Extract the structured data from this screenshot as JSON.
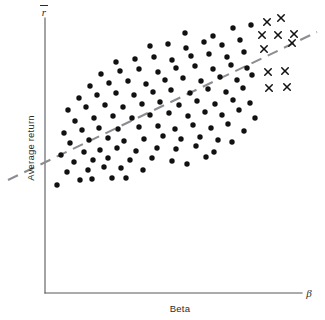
{
  "figure": {
    "title": "",
    "y_axis_symbol": "r",
    "y_axis_symbol_note": "r-bar (average return)",
    "x_axis_symbol": "β",
    "y_axis_label": "Average return",
    "x_axis_label": "Beta"
  },
  "colors": {
    "dot": "#111111",
    "cross": "#111111",
    "fit_line": "#8a8d91",
    "axis": "#55585c",
    "background": "#ffffff",
    "text": "#2b2b2b"
  },
  "chart_data": {
    "type": "scatter",
    "title": "",
    "xlabel": "Beta",
    "ylabel": "Average return",
    "xlim": [
      0,
      1
    ],
    "ylim": [
      0,
      1
    ],
    "grid": false,
    "legend": null,
    "axis_ticks": {
      "x": [],
      "y": []
    },
    "annotations": [
      {
        "text": "r",
        "role": "y-axis-symbol",
        "x": 0.0,
        "y": 1.0
      },
      {
        "text": "β",
        "role": "x-axis-symbol",
        "x": 1.0,
        "y": 0.0
      }
    ],
    "series": [
      {
        "name": "portfolios",
        "marker": "filled-circle",
        "color": "#111111",
        "size": 5.4,
        "count": 110,
        "points": [
          [
            57,
            185
          ],
          [
            80,
            180
          ],
          [
            92,
            179
          ],
          [
            112,
            178
          ],
          [
            126,
            178
          ],
          [
            67,
            172
          ],
          [
            88,
            170
          ],
          [
            104,
            167
          ],
          [
            121,
            168
          ],
          [
            143,
            170
          ],
          [
            74,
            162
          ],
          [
            93,
            160
          ],
          [
            108,
            158
          ],
          [
            130,
            160
          ],
          [
            152,
            158
          ],
          [
            172,
            161
          ],
          [
            187,
            164
          ],
          [
            206,
            157
          ],
          [
            61,
            155
          ],
          [
            84,
            152
          ],
          [
            100,
            150
          ],
          [
            117,
            148
          ],
          [
            136,
            151
          ],
          [
            157,
            148
          ],
          [
            176,
            149
          ],
          [
            196,
            146
          ],
          [
            214,
            152
          ],
          [
            70,
            143
          ],
          [
            89,
            140
          ],
          [
            108,
            138
          ],
          [
            124,
            141
          ],
          [
            144,
            139
          ],
          [
            163,
            136
          ],
          [
            181,
            139
          ],
          [
            200,
            137
          ],
          [
            218,
            140
          ],
          [
            232,
            142
          ],
          [
            64,
            133
          ],
          [
            82,
            130
          ],
          [
            99,
            128
          ],
          [
            118,
            129
          ],
          [
            139,
            127
          ],
          [
            158,
            126
          ],
          [
            175,
            129
          ],
          [
            193,
            125
          ],
          [
            211,
            128
          ],
          [
            228,
            124
          ],
          [
            244,
            131
          ],
          [
            75,
            121
          ],
          [
            94,
            118
          ],
          [
            113,
            116
          ],
          [
            132,
            118
          ],
          [
            150,
            115
          ],
          [
            169,
            113
          ],
          [
            188,
            116
          ],
          [
            205,
            112
          ],
          [
            222,
            115
          ],
          [
            239,
            110
          ],
          [
            255,
            118
          ],
          [
            68,
            110
          ],
          [
            86,
            107
          ],
          [
            105,
            105
          ],
          [
            123,
            107
          ],
          [
            142,
            104
          ],
          [
            160,
            102
          ],
          [
            179,
            105
          ],
          [
            197,
            101
          ],
          [
            215,
            104
          ],
          [
            233,
            100
          ],
          [
            250,
            103
          ],
          [
            79,
            98
          ],
          [
            97,
            95
          ],
          [
            116,
            93
          ],
          [
            134,
            95
          ],
          [
            153,
            92
          ],
          [
            171,
            90
          ],
          [
            190,
            93
          ],
          [
            208,
            89
          ],
          [
            226,
            92
          ],
          [
            243,
            88
          ],
          [
            90,
            86
          ],
          [
            109,
            83
          ],
          [
            128,
            81
          ],
          [
            146,
            84
          ],
          [
            165,
            80
          ],
          [
            183,
            78
          ],
          [
            201,
            81
          ],
          [
            220,
            77
          ],
          [
            237,
            80
          ],
          [
            252,
            75
          ],
          [
            101,
            74
          ],
          [
            120,
            71
          ],
          [
            139,
            69
          ],
          [
            158,
            72
          ],
          [
            176,
            68
          ],
          [
            195,
            66
          ],
          [
            213,
            69
          ],
          [
            231,
            65
          ],
          [
            247,
            68
          ],
          [
            116,
            62
          ],
          [
            135,
            59
          ],
          [
            154,
            57
          ],
          [
            172,
            60
          ],
          [
            191,
            56
          ],
          [
            209,
            54
          ],
          [
            227,
            57
          ],
          [
            244,
            52
          ],
          [
            150,
            46
          ],
          [
            168,
            44
          ],
          [
            186,
            48
          ],
          [
            204,
            42
          ],
          [
            222,
            45
          ],
          [
            240,
            40
          ],
          [
            185,
            33
          ],
          [
            213,
            36
          ],
          [
            233,
            28
          ],
          [
            251,
            25
          ]
        ]
      },
      {
        "name": "high-beta outliers",
        "marker": "x",
        "color": "#111111",
        "size": 6.5,
        "count": 13,
        "points": [
          [
            267,
            22
          ],
          [
            281,
            18
          ],
          [
            262,
            35
          ],
          [
            278,
            35
          ],
          [
            294,
            34
          ],
          [
            264,
            49
          ],
          [
            292,
            43
          ],
          [
            268,
            72
          ],
          [
            285,
            71
          ],
          [
            269,
            88
          ],
          [
            287,
            87
          ]
        ]
      }
    ],
    "fit_line": {
      "style": "dashed",
      "color": "#8a8d91",
      "x_start": 8,
      "y_start": 180,
      "x_end": 317,
      "y_end": 32
    },
    "axes_geometry": {
      "origin_x": 45,
      "origin_y": 293,
      "y_top": 18,
      "x_right": 302
    }
  }
}
